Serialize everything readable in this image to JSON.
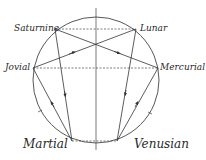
{
  "diagram": {
    "title": "",
    "colors": {
      "line": "#333333",
      "background": "#ffffff"
    },
    "circle": {
      "cx": 96,
      "cy": 80,
      "r": 63
    },
    "axis": {
      "x": 96,
      "y1": 8,
      "y2": 150
    },
    "nodes": [
      {
        "id": "saturnine",
        "label": "Saturnine",
        "x": 55,
        "y": 29
      },
      {
        "id": "lunar",
        "label": "Lunar",
        "x": 136,
        "y": 29
      },
      {
        "id": "jovial",
        "label": "Jovial",
        "x": 33,
        "y": 68
      },
      {
        "id": "mercurial",
        "label": "Mercurial",
        "x": 158,
        "y": 68
      },
      {
        "id": "martial",
        "label": "Martial",
        "x": 72,
        "y": 141
      },
      {
        "id": "venusian",
        "label": "Venusian",
        "x": 117,
        "y": 141
      }
    ],
    "edges": [
      {
        "from": "saturnine",
        "to": "martial",
        "style": "solid",
        "arrow": "toward-martial"
      },
      {
        "from": "martial",
        "to": "jovial",
        "style": "solid",
        "arrow": "toward-jovial"
      },
      {
        "from": "jovial",
        "to": "lunar",
        "style": "solid",
        "arrow": "toward-lunar"
      },
      {
        "from": "saturnine",
        "to": "mercurial",
        "style": "solid",
        "arrow": "toward-mercurial"
      },
      {
        "from": "lunar",
        "to": "venusian",
        "style": "solid",
        "arrow": "toward-venusian"
      },
      {
        "from": "venusian",
        "to": "mercurial",
        "style": "solid",
        "arrow": "toward-mercurial"
      },
      {
        "from": "saturnine",
        "to": "lunar",
        "style": "dashed"
      },
      {
        "from": "jovial",
        "to": "mercurial",
        "style": "dashed"
      },
      {
        "from": "martial",
        "to": "venusian",
        "style": "dashed"
      }
    ],
    "labels": {
      "saturnine": "Saturnine",
      "lunar": "Lunar",
      "jovial": "Jovial",
      "mercurial": "Mercurial",
      "martial": "Martial",
      "venusian": "Venusian"
    }
  }
}
